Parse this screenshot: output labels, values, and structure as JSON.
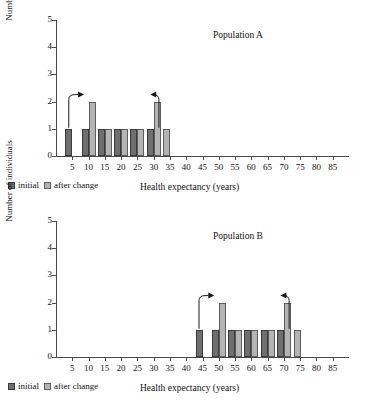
{
  "figure": {
    "legend": {
      "initial_label": "initial",
      "after_label": "after change"
    },
    "axis": {
      "xlabel": "Health expectancy (years)",
      "ylabel": "Number of individuals"
    },
    "colors": {
      "initial": "#6f6f6f",
      "after": "#b4b4b4",
      "axis": "#4a4a4a",
      "text": "#111111",
      "background": "#ffffff"
    }
  },
  "chart_data": [
    {
      "type": "bar",
      "title": "Population A",
      "xlabel": "Health expectancy (years)",
      "ylabel": "Number of individuals",
      "xlim": [
        0,
        90
      ],
      "ylim": [
        0,
        5
      ],
      "xticks": [
        5,
        10,
        15,
        20,
        25,
        30,
        35,
        40,
        45,
        50,
        55,
        60,
        65,
        70,
        75,
        80,
        85
      ],
      "yticks": [
        0,
        1,
        2,
        3,
        4,
        5
      ],
      "grid": false,
      "legend_position": "below-left",
      "categories": [
        5,
        10,
        15,
        20,
        25,
        30,
        33
      ],
      "series": [
        {
          "name": "initial",
          "values": [
            1,
            1,
            1,
            1,
            1,
            1,
            0
          ]
        },
        {
          "name": "after change",
          "values": [
            0,
            2,
            1,
            1,
            1,
            2,
            1
          ]
        }
      ],
      "annotations": [
        {
          "type": "arrow",
          "label": "",
          "from_x": 5,
          "to_x": 10,
          "direction": "right"
        },
        {
          "type": "arrow",
          "label": "",
          "from_x": 30,
          "to_x": 33,
          "direction": "right"
        }
      ]
    },
    {
      "type": "bar",
      "title": "Population B",
      "xlabel": "Health expectancy (years)",
      "ylabel": "Number of individuals",
      "xlim": [
        0,
        90
      ],
      "ylim": [
        0,
        5
      ],
      "xticks": [
        5,
        10,
        15,
        20,
        25,
        30,
        35,
        40,
        45,
        50,
        55,
        60,
        65,
        70,
        75,
        80,
        85
      ],
      "yticks": [
        0,
        1,
        2,
        3,
        4,
        5
      ],
      "grid": false,
      "legend_position": "below-left",
      "categories": [
        45,
        50,
        55,
        60,
        65,
        70,
        73
      ],
      "series": [
        {
          "name": "initial",
          "values": [
            1,
            1,
            1,
            1,
            1,
            1,
            0
          ]
        },
        {
          "name": "after change",
          "values": [
            0,
            2,
            1,
            1,
            1,
            2,
            1
          ]
        }
      ],
      "annotations": [
        {
          "type": "arrow",
          "label": "",
          "from_x": 45,
          "to_x": 50,
          "direction": "right"
        },
        {
          "type": "arrow",
          "label": "",
          "from_x": 70,
          "to_x": 73,
          "direction": "right"
        }
      ]
    }
  ]
}
